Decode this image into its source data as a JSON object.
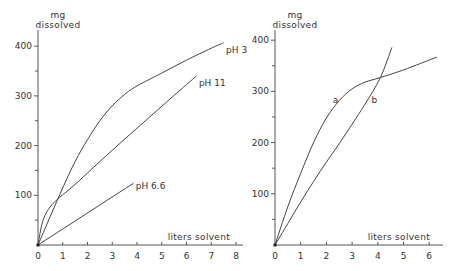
{
  "chart_data": [
    {
      "type": "line",
      "title": "",
      "xlabel": "liters solvent",
      "ylabel": "mg dissolved",
      "ylabel_lines": [
        "mg",
        "dissolved"
      ],
      "xlim": [
        0,
        8
      ],
      "ylim": [
        0,
        400
      ],
      "x_ticks": [
        0,
        1,
        2,
        3,
        4,
        5,
        6,
        7,
        8
      ],
      "y_ticks_labeled": [
        100,
        200,
        300,
        400
      ],
      "y_ticks_minor": [
        50,
        150,
        250,
        350
      ],
      "grid": false,
      "legend": "inline labels at curve ends",
      "series": [
        {
          "name": "pH 3",
          "x": [
            0,
            0.5,
            1.0,
            1.5,
            2.0,
            2.5,
            3.0,
            3.5,
            4.0,
            5.0,
            6.0,
            7.0,
            7.5
          ],
          "y": [
            0,
            58,
            115,
            168,
            212,
            250,
            280,
            303,
            320,
            346,
            372,
            396,
            407
          ]
        },
        {
          "name": "pH 11",
          "x": [
            0,
            0.15,
            0.35,
            0.7,
            1.5,
            2.5,
            3.5,
            4.5,
            5.5,
            6.4
          ],
          "y": [
            0,
            40,
            66,
            88,
            122,
            168,
            213,
            257,
            301,
            340
          ]
        },
        {
          "name": "pH 6.6",
          "x": [
            0,
            3.85
          ],
          "y": [
            0,
            124
          ]
        }
      ],
      "annotations": [
        {
          "text": "pH 3",
          "x": 7.6,
          "y": 392
        },
        {
          "text": "pH 11",
          "x": 6.5,
          "y": 325
        },
        {
          "text": "pH 6.6",
          "x": 3.95,
          "y": 118
        }
      ]
    },
    {
      "type": "line",
      "title": "",
      "xlabel": "liters solvent",
      "ylabel": "mg dissolved",
      "ylabel_lines": [
        "mg",
        "dissolved"
      ],
      "xlim": [
        0,
        6.5
      ],
      "ylim": [
        0,
        400
      ],
      "x_ticks": [
        0,
        1,
        2,
        3,
        4,
        5,
        6
      ],
      "y_ticks_labeled": [
        100,
        200,
        300,
        400
      ],
      "y_ticks_minor": [
        50,
        150,
        250,
        350
      ],
      "grid": false,
      "legend": "inline labels on curves",
      "series": [
        {
          "name": "a",
          "x": [
            0,
            0.5,
            1.0,
            1.5,
            2.0,
            2.5,
            3.0,
            3.5,
            4.1,
            5.0,
            6.3
          ],
          "y": [
            0,
            75,
            140,
            200,
            248,
            282,
            305,
            318,
            327,
            342,
            367
          ]
        },
        {
          "name": "b",
          "x": [
            0,
            0.5,
            1.0,
            1.5,
            2.0,
            2.5,
            3.0,
            3.5,
            4.1,
            4.55
          ],
          "y": [
            0,
            42,
            84,
            124,
            162,
            198,
            236,
            275,
            327,
            386
          ]
        }
      ],
      "annotations": [
        {
          "text": "a",
          "x": 2.25,
          "y": 283
        },
        {
          "text": "b",
          "x": 3.75,
          "y": 283
        }
      ]
    }
  ],
  "panels": [
    {
      "ylabel_top": "mg",
      "ylabel_bottom": "dissolved",
      "xlabel": "liters solvent",
      "labels": {
        "pH3": "pH 3",
        "pH11": "pH 11",
        "pH66": "pH 6.6"
      }
    },
    {
      "ylabel_top": "mg",
      "ylabel_bottom": "dissolved",
      "xlabel": "liters solvent",
      "labels": {
        "a": "a",
        "b": "b"
      }
    }
  ]
}
